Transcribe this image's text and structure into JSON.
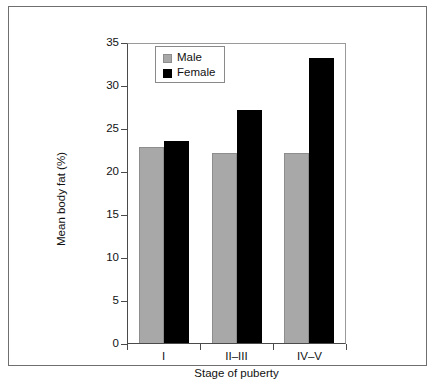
{
  "chart_data": {
    "type": "bar",
    "title": "",
    "subtitle": "",
    "xlabel": "Stage of puberty",
    "ylabel": "Mean body fat (%)",
    "categories": [
      "I",
      "II–III",
      "IV–V"
    ],
    "series": [
      {
        "name": "Male",
        "color": "#a8a8a8",
        "values": [
          23.0,
          22.2,
          22.3
        ]
      },
      {
        "name": "Female",
        "color": "#000000",
        "values": [
          23.7,
          27.3,
          33.4
        ]
      }
    ],
    "ylim": [
      0,
      35
    ],
    "yticks": [
      0,
      5,
      10,
      15,
      20,
      25,
      30,
      35
    ],
    "ytick_labels": [
      "0",
      "5",
      "10",
      "15",
      "20",
      "25",
      "30",
      "35"
    ],
    "grid": false,
    "legend_position": "top-left",
    "legend_entries": [
      "Male",
      "Female"
    ]
  },
  "figure": {
    "border_color": "#6f6f6f",
    "axis_color": "#4a4a4a",
    "background": "#ffffff"
  },
  "caption": {
    "clipped_text": ""
  }
}
